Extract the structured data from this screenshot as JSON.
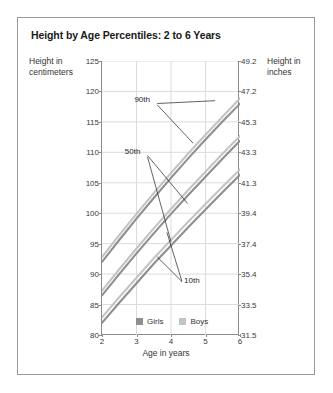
{
  "figure": {
    "title": "Height by Age Percentiles: 2 to 6 Years",
    "border_color": "#9a9a9a",
    "background": "#ffffff"
  },
  "axes": {
    "left_title": "Height in centimeters",
    "right_title": "Height in inches",
    "x_title": "Age in years",
    "axis_color": "#8c8c8c",
    "grid_color": "#dcdcdc"
  },
  "legend": {
    "items": [
      {
        "label": "Girls",
        "color": "#8f8f8f"
      },
      {
        "label": "Boys",
        "color": "#c4c4c4"
      }
    ]
  },
  "annotations": [
    {
      "name": "90th",
      "label": "90th"
    },
    {
      "name": "50th",
      "label": "50th"
    },
    {
      "name": "10th",
      "label": "10th"
    }
  ],
  "chart_data": {
    "type": "line",
    "title": "Height by Age Percentiles: 2 to 6 Years",
    "xlabel": "Age in years",
    "ylabel": "Height in centimeters",
    "ylabel_secondary": "Height in inches",
    "xlim": [
      2,
      6
    ],
    "ylim": [
      80,
      125
    ],
    "xticks": [
      2,
      3,
      4,
      5,
      6
    ],
    "yticks_left": [
      80,
      85,
      90,
      95,
      100,
      105,
      110,
      115,
      120,
      125
    ],
    "yticks_right": [
      31.5,
      33.5,
      35.4,
      37.4,
      39.4,
      41.3,
      43.3,
      45.3,
      47.2,
      49.2
    ],
    "ytick_right_map": {
      "80": "31.5",
      "85": "33.5",
      "90": "35.4",
      "95": "37.4",
      "100": "39.4",
      "105": "41.3",
      "110": "43.3",
      "115": "45.3",
      "120": "47.2",
      "125": "49.2"
    },
    "grid": true,
    "legend_position": "bottom-center",
    "x": [
      2,
      2.5,
      3,
      3.5,
      4,
      4.5,
      5,
      5.5,
      6
    ],
    "series": [
      {
        "name": "Girls 90th",
        "percentile": "90th",
        "sex": "Girls",
        "color": "#8f8f8f",
        "values": [
          92.0,
          95.6,
          99.1,
          102.5,
          105.8,
          109.0,
          112.1,
          115.1,
          118.0
        ]
      },
      {
        "name": "Boys 90th",
        "percentile": "90th",
        "sex": "Boys",
        "color": "#c4c4c4",
        "values": [
          92.8,
          96.4,
          99.9,
          103.3,
          106.6,
          109.8,
          112.9,
          115.9,
          118.9
        ]
      },
      {
        "name": "Girls 50th",
        "percentile": "50th",
        "sex": "Girls",
        "color": "#8f8f8f",
        "values": [
          86.5,
          90.0,
          93.4,
          96.7,
          99.9,
          103.0,
          106.0,
          109.0,
          111.9
        ]
      },
      {
        "name": "Boys 50th",
        "percentile": "50th",
        "sex": "Boys",
        "color": "#c4c4c4",
        "values": [
          87.3,
          90.8,
          94.2,
          97.5,
          100.7,
          103.8,
          106.8,
          109.8,
          112.7
        ]
      },
      {
        "name": "Girls 10th",
        "percentile": "10th",
        "sex": "Girls",
        "color": "#8f8f8f",
        "values": [
          82.0,
          85.3,
          88.5,
          91.7,
          94.7,
          97.7,
          100.6,
          103.5,
          106.3
        ]
      },
      {
        "name": "Boys 10th",
        "percentile": "10th",
        "sex": "Boys",
        "color": "#c4c4c4",
        "values": [
          82.9,
          86.2,
          89.4,
          92.6,
          95.6,
          98.6,
          101.5,
          104.4,
          107.2
        ]
      }
    ]
  }
}
